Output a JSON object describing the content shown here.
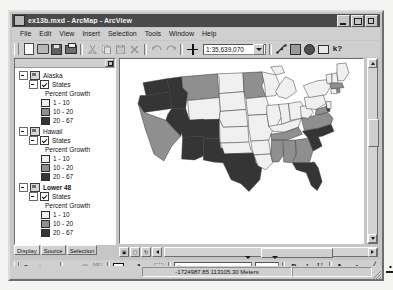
{
  "window": {
    "title": "ex13b.mxd - ArcMap - ArcView",
    "app_icon": "arcmap-icon",
    "minimize": "_",
    "maximize": "□",
    "close": "✕"
  },
  "menu": {
    "items": [
      "File",
      "Edit",
      "View",
      "Insert",
      "Selection",
      "Tools",
      "Window",
      "Help"
    ]
  },
  "toolbar": {
    "scale_value": "1:35,639,070",
    "buttons": [
      {
        "name": "new-document-button",
        "label": "New"
      },
      {
        "name": "open-document-button",
        "label": "Open"
      },
      {
        "name": "save-document-button",
        "label": "Save"
      },
      {
        "name": "print-button",
        "label": "Print"
      },
      {
        "name": "cut-button",
        "label": "Cut"
      },
      {
        "name": "copy-button",
        "label": "Copy"
      },
      {
        "name": "paste-button",
        "label": "Paste"
      },
      {
        "name": "delete-button",
        "label": "Delete"
      },
      {
        "name": "undo-button",
        "label": "Undo"
      },
      {
        "name": "redo-button",
        "label": "Redo"
      },
      {
        "name": "add-data-button",
        "label": "Add Data"
      },
      {
        "name": "editor-toolbar-button",
        "label": "Editor Toolbar"
      },
      {
        "name": "arctoolbox-button",
        "label": "ArcToolbox"
      },
      {
        "name": "arccatalog-button",
        "label": "ArcCatalog"
      },
      {
        "name": "layout-view-button",
        "label": "Layout"
      },
      {
        "name": "whats-this-help-button",
        "label": "What's This?"
      }
    ]
  },
  "toc": {
    "tabs": [
      {
        "label": "Display",
        "active": true
      },
      {
        "label": "Source",
        "active": false
      },
      {
        "label": "Selection",
        "active": false
      }
    ],
    "frames": [
      {
        "name": "Alaska",
        "bold": false,
        "layer": "States",
        "field": "Percent Growth",
        "classes": [
          {
            "label": "1 - 10",
            "color": "#f0f0f0"
          },
          {
            "label": "10 - 20",
            "color": "#8f8f8f"
          },
          {
            "label": "20 - 67",
            "color": "#353535"
          }
        ]
      },
      {
        "name": "Hawaii",
        "bold": false,
        "layer": "States",
        "field": "Percent Growth",
        "classes": [
          {
            "label": "1 - 10",
            "color": "#f0f0f0"
          },
          {
            "label": "10 - 20",
            "color": "#8f8f8f"
          },
          {
            "label": "20 - 67",
            "color": "#353535"
          }
        ]
      },
      {
        "name": "Lower 48",
        "bold": true,
        "layer": "States",
        "field": "Percent Growth",
        "classes": [
          {
            "label": "1 - 10",
            "color": "#f0f0f0"
          },
          {
            "label": "10 - 20",
            "color": "#8f8f8f"
          },
          {
            "label": "20 - 67",
            "color": "#353535"
          }
        ]
      }
    ]
  },
  "map": {
    "title": "Lower 48 States - Percent Growth choropleth",
    "background": "#ffffff",
    "class_colors": {
      "low": "#f0f0f0",
      "medium": "#8f8f8f",
      "high": "#353535"
    }
  },
  "drawbar": {
    "menu_label": "Drawing",
    "font_name": "Arial",
    "font_size": "10",
    "bold_label": "B",
    "italic_label": "I",
    "underline_label": "U",
    "buttons": [
      {
        "name": "select-elements-button",
        "label": "Select Elements"
      },
      {
        "name": "rotate-element-button",
        "label": "Rotate"
      },
      {
        "name": "group-elements-button",
        "label": "Group"
      },
      {
        "name": "new-rectangle-button",
        "label": "New Rectangle"
      },
      {
        "name": "new-text-button",
        "label": "New Text"
      },
      {
        "name": "nudge-button",
        "label": "Nudge"
      },
      {
        "name": "font-color-button",
        "label": "Font Color"
      },
      {
        "name": "fill-color-button",
        "label": "Fill Color"
      },
      {
        "name": "line-color-button",
        "label": "Line Color"
      },
      {
        "name": "marker-color-button",
        "label": "Marker Color"
      }
    ]
  },
  "status": {
    "coordinates": "-1724987.85  113105.30 Meters"
  }
}
